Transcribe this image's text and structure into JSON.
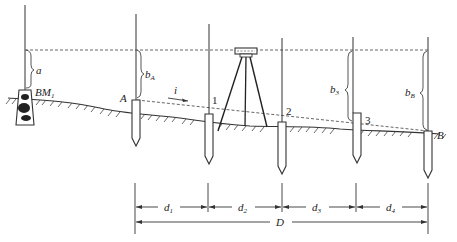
{
  "diagram": {
    "labels": {
      "benchmark": "BM",
      "benchmark_sub": "1",
      "backsight": "a",
      "point_A": "A",
      "point_B": "B",
      "point_1": "1",
      "point_2": "2",
      "point_3": "3",
      "gradient": "i",
      "reading_A": "b",
      "reading_A_sub": "A",
      "reading_3": "b",
      "reading_3_sub": "3",
      "reading_B": "b",
      "reading_B_sub": "B"
    },
    "dimensions": {
      "d1": "d",
      "d1_sub": "1",
      "d2": "d",
      "d2_sub": "2",
      "d3": "d",
      "d3_sub": "3",
      "d4": "d",
      "d4_sub": "4",
      "total": "D"
    },
    "colors": {
      "line": "#333333",
      "background": "#ffffff"
    }
  }
}
